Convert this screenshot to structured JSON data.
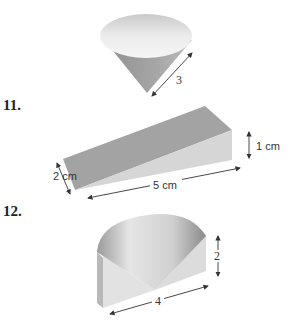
{
  "problems": [
    {
      "number": "",
      "figure": "cone",
      "labels": {
        "slant": "3"
      }
    },
    {
      "number": "11.",
      "figure": "wedge",
      "labels": {
        "height": "1 cm",
        "width": "2 cm",
        "length": "5 cm"
      }
    },
    {
      "number": "12.",
      "figure": "cylinder-sector-with-cone-cut",
      "labels": {
        "height": "2",
        "width": "4"
      }
    }
  ]
}
